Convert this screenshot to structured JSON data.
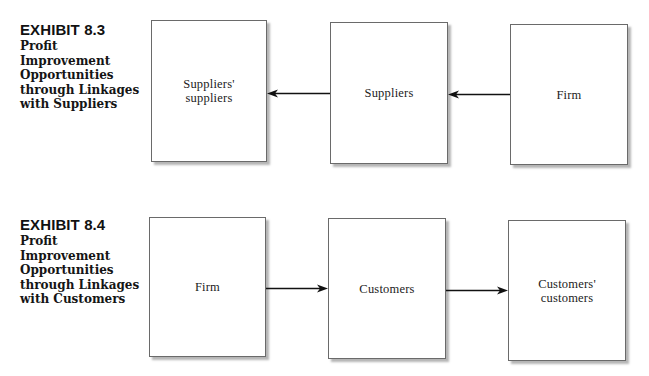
{
  "exhibits": [
    {
      "number": "EXHIBIT 8.3",
      "title_lines": [
        "Profit",
        "Improvement",
        "Opportunities",
        "through Linkages",
        "with Suppliers"
      ],
      "boxes": [
        {
          "label_lines": [
            "Suppliers'",
            "suppliers"
          ]
        },
        {
          "label_lines": [
            "Suppliers"
          ]
        },
        {
          "label_lines": [
            "Firm"
          ]
        }
      ],
      "arrows": [
        {
          "from": "Suppliers",
          "to": "Suppliers' suppliers",
          "direction": "left"
        },
        {
          "from": "Firm",
          "to": "Suppliers",
          "direction": "left"
        }
      ]
    },
    {
      "number": "EXHIBIT 8.4",
      "title_lines": [
        "Profit",
        "Improvement",
        "Opportunities",
        "through Linkages",
        "with Customers"
      ],
      "boxes": [
        {
          "label_lines": [
            "Firm"
          ]
        },
        {
          "label_lines": [
            "Customers"
          ]
        },
        {
          "label_lines": [
            "Customers'",
            "customers"
          ]
        }
      ],
      "arrows": [
        {
          "from": "Firm",
          "to": "Customers",
          "direction": "right"
        },
        {
          "from": "Customers",
          "to": "Customers' customers",
          "direction": "right"
        }
      ]
    }
  ]
}
